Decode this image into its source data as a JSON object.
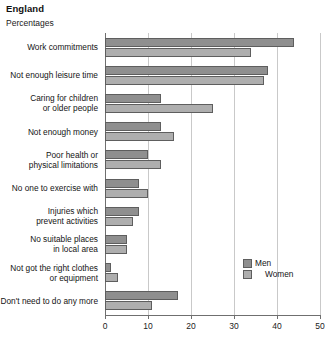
{
  "header": {
    "title": "England",
    "subtitle": "Percentages"
  },
  "legend": {
    "men_label": "Men",
    "women_label": "Women"
  },
  "colors": {
    "men": "#8f8f8f",
    "women": "#aeaeae",
    "grid": "#c9c9c9",
    "axis": "#6f6f6f"
  },
  "chart_data": {
    "type": "bar",
    "orientation": "horizontal",
    "title": "England",
    "subtitle": "Percentages",
    "xlabel": "",
    "ylabel": "",
    "xlim": [
      0,
      50
    ],
    "xticks": [
      0,
      10,
      20,
      30,
      40,
      50
    ],
    "grid": true,
    "legend_position": "inside-right",
    "categories": [
      "Work commitments",
      "Not enough leisure time",
      "Caring for children\nor older people",
      "Not enough money",
      "Poor health or\nphysical limitations",
      "No one to exercise with",
      "Injuries which\nprevent activities",
      "No suitable places\nin local area",
      "Not got the right clothes\nor equipment",
      "Don't need to do any more"
    ],
    "category_lines": [
      [
        "Work commitments"
      ],
      [
        "Not enough leisure time"
      ],
      [
        "Caring for children",
        "or older people"
      ],
      [
        "Not enough money"
      ],
      [
        "Poor health or",
        "physical limitations"
      ],
      [
        "No one to exercise with"
      ],
      [
        "Injuries which",
        "prevent activities"
      ],
      [
        "No suitable places",
        "in local area"
      ],
      [
        "Not got the right clothes",
        "or equipment"
      ],
      [
        "Don't need to do any more"
      ]
    ],
    "series": [
      {
        "name": "Men",
        "values": [
          44,
          38,
          13,
          13,
          10,
          8,
          8,
          5,
          1.5,
          17
        ]
      },
      {
        "name": "Women",
        "values": [
          34,
          37,
          25,
          16,
          13,
          10,
          6.5,
          5,
          3,
          11
        ]
      }
    ]
  }
}
